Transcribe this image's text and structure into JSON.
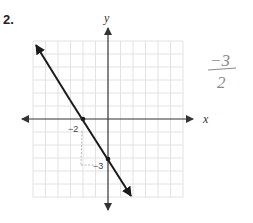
{
  "problem": {
    "number": "2.",
    "axes": {
      "x_label": "x",
      "y_label": "y",
      "range": [
        -6,
        6
      ]
    },
    "line": {
      "x_intercept": -2,
      "y_intercept": -3,
      "slope": "-3/2"
    },
    "annotations": {
      "x_intercept_label": "−2",
      "y_intercept_label": "−3",
      "handwritten_numerator": "−3",
      "handwritten_denominator": "2"
    },
    "colors": {
      "grid": "#e2e2e2",
      "axis": "#333333",
      "line": "#1a1a1a",
      "pencil": "#8a8a8a"
    }
  }
}
